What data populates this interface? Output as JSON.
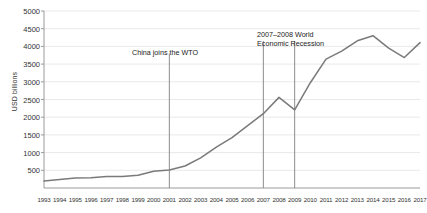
{
  "chart_data": {
    "type": "line",
    "title": "",
    "xlabel": "",
    "ylabel": "USD billions",
    "ylim": [
      0,
      5000
    ],
    "ytick_step": 500,
    "grid": true,
    "legend": "none",
    "line_color": "#7a7a7a",
    "gridline_color": "#e9e9e9",
    "axis_color": "#9a9a9a",
    "categories": [
      "1993",
      "1994",
      "1995",
      "1996",
      "1997",
      "1998",
      "1999",
      "2000",
      "2001",
      "2002",
      "2003",
      "2004",
      "2005",
      "2006",
      "2007",
      "2008",
      "2009",
      "2010",
      "2011",
      "2012",
      "2013",
      "2014",
      "2015",
      "2016",
      "2017"
    ],
    "ytick_labels": [
      "5000",
      "4500",
      "4000",
      "3500",
      "3000",
      "2500",
      "2000",
      "1500",
      "1000",
      "500"
    ],
    "ytick_values": [
      5000,
      4500,
      4000,
      3500,
      3000,
      2500,
      2000,
      1500,
      1000,
      500
    ],
    "series": [
      {
        "name": "China total trade",
        "values": [
          195,
          237,
          281,
          290,
          325,
          324,
          361,
          474,
          510,
          621,
          851,
          1155,
          1422,
          1760,
          2100,
          2560,
          2208,
          2974,
          3642,
          3867,
          4159,
          4303,
          3953,
          3686,
          4107
        ]
      }
    ],
    "annotations": [
      {
        "id": "wto",
        "text": "China joins the WTO",
        "x_category": "2001",
        "text_x_px": 132,
        "text_y_px": 48,
        "line_top_value": 3800,
        "line_bottom_value": 0
      },
      {
        "id": "recession",
        "text_line1": "2007–2008 World",
        "text_line2": "Economic Recession",
        "x_category_start": "2007",
        "x_category_end": "2009",
        "text_x_px": 257,
        "text_y_px": 30,
        "line_top_value": 4150,
        "line_bottom_value": 0
      }
    ]
  }
}
